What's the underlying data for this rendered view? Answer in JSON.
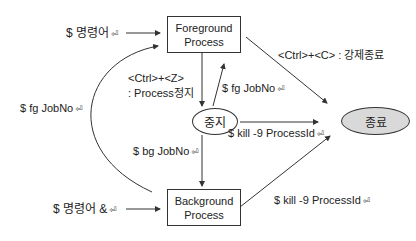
{
  "diagram": {
    "nodes": {
      "foreground": {
        "line1": "Foreground",
        "line2": "Process"
      },
      "background": {
        "line1": "Background",
        "line2": "Process"
      },
      "stopped": {
        "label": "중지"
      },
      "terminated": {
        "label": "종료",
        "fill": "#d9d9d9"
      }
    },
    "edges": {
      "cmd_to_fg": {
        "label": "$ 명령어",
        "return_icon": "⏎"
      },
      "bg_to_fg": {
        "label": "$ fg JobNo",
        "return_icon": "⏎"
      },
      "fg_to_stopped": {
        "line1": "<Ctrl>+<Z>",
        "line2": ": Process정지"
      },
      "stopped_to_fg": {
        "label": "$ fg JobNo",
        "return_icon": "⏎"
      },
      "fg_to_terminated": {
        "label": "<Ctrl>+<C> : 강제종료"
      },
      "stopped_to_terminated": {
        "label": "$ kill -9 ProcessId",
        "return_icon": "⏎"
      },
      "stopped_to_bg": {
        "label": "$ bg JobNo",
        "return_icon": "⏎"
      },
      "cmd_to_bg": {
        "label": "$ 명령어 &",
        "return_icon": "⏎"
      },
      "bg_to_terminated": {
        "label": "$ kill -9 ProcessId",
        "return_icon": "⏎"
      }
    },
    "colors": {
      "line": "#333333",
      "terminated_fill": "#d9d9d9",
      "background": "#ffffff"
    }
  }
}
